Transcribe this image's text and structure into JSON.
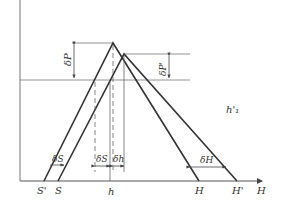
{
  "diagram": {
    "colors": {
      "line": "#3a3a3a",
      "thin": "#666666",
      "background": "#ffffff"
    },
    "labels": {
      "delta_P": "δP",
      "delta_P_prime": "δP'",
      "h1_prime": "h'₁",
      "delta_S_left": "δS",
      "delta_S_mid": "δS",
      "delta_h": "δh",
      "delta_h_sub": "1",
      "delta_H": "δH",
      "S_prime": "S'",
      "S": "S",
      "h": "h",
      "H": "H",
      "H_prime": "H'",
      "axis_H": "H"
    }
  }
}
